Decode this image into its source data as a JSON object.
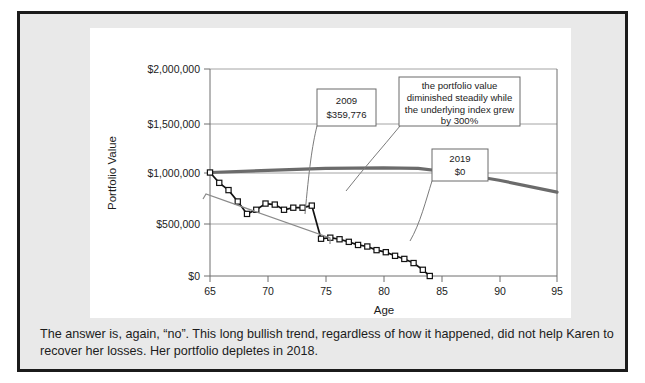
{
  "caption": "The answer is, again, “no”. This long bullish trend, regardless of how it happened, did not help Karen to recover her losses. Her portfolio depletes in 2018.",
  "chart_data": {
    "type": "line",
    "title": "",
    "xlabel": "Age",
    "ylabel": "Portfolio Value",
    "xlim": [
      65,
      95
    ],
    "ylim": [
      0,
      2000000
    ],
    "xticks": [
      65,
      70,
      75,
      80,
      85,
      90,
      95
    ],
    "xticklabels": [
      "65",
      "70",
      "75",
      "80",
      "85",
      "90",
      "95"
    ],
    "yticks": [
      0,
      500000,
      1000000,
      1500000,
      2000000
    ],
    "yticklabels": [
      "$0",
      "$500,000",
      "$1,000,000",
      "$1,500,000",
      "$2,000,000"
    ],
    "grid": true,
    "legend": "none",
    "series": [
      {
        "name": "Portfolio Value",
        "style": "line-with-square-markers",
        "color": "#121212",
        "x": [
          65,
          65.8,
          66.6,
          67.4,
          68.2,
          69,
          69.8,
          70.6,
          71.4,
          72.2,
          73,
          73.8,
          74.6,
          75.4,
          76.2,
          77,
          77.8,
          78.6,
          79.4,
          80.2,
          81,
          81.8,
          82.6,
          83.4,
          84.0
        ],
        "y": [
          1000000,
          900000,
          830000,
          720000,
          600000,
          640000,
          700000,
          690000,
          640000,
          660000,
          660000,
          680000,
          360000,
          370000,
          355000,
          330000,
          300000,
          285000,
          250000,
          230000,
          195000,
          165000,
          125000,
          60000,
          0
        ]
      },
      {
        "name": "Underlying Index",
        "style": "thick-line",
        "color": "#6b6b6b",
        "x": [
          65,
          70,
          75,
          80,
          83,
          86,
          90,
          95
        ],
        "y": [
          1000000,
          1020000,
          1040000,
          1045000,
          1040000,
          1000000,
          925000,
          810000
        ]
      }
    ],
    "annotations": [
      {
        "name": "callout-2009",
        "lines": [
          "2009",
          "$359,776"
        ],
        "box": {
          "x": 297,
          "y": 129,
          "w": 59,
          "h": 37
        },
        "points_to": {
          "x": 74.6,
          "y": 360000
        }
      },
      {
        "name": "callout-description",
        "lines": [
          "the portfolio value",
          "diminished steadily while",
          "the underlying index grew",
          "by 300%"
        ],
        "box": {
          "x": 379,
          "y": 117,
          "w": 121,
          "h": 49
        },
        "points_to": {
          "x": 79.0,
          "y": 300000
        }
      },
      {
        "name": "callout-2019",
        "lines": [
          "2019",
          "$0"
        ],
        "box": {
          "x": 412,
          "y": 189,
          "w": 56,
          "h": 32
        },
        "points_to": {
          "x": 84.0,
          "y": 0
        }
      }
    ]
  }
}
